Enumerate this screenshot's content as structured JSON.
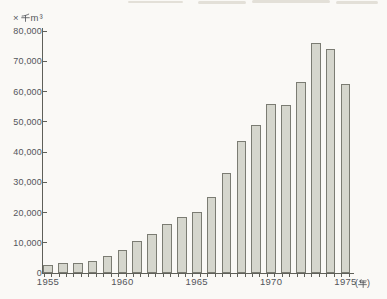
{
  "colors": {
    "background": "#faf9f6",
    "bar_fill": "#d5d6cd",
    "bar_border": "#7b7c73",
    "axis": "#5f6059",
    "text": "#53555a",
    "scan_artifact": "#dcd8cf"
  },
  "chart_data": {
    "type": "bar",
    "title": "",
    "unit_label": "×千m³",
    "x_axis_suffix": "(年)",
    "xlabel": "年",
    "ylabel": "千m³",
    "categories": [
      1955,
      1956,
      1957,
      1958,
      1959,
      1960,
      1961,
      1962,
      1963,
      1964,
      1965,
      1966,
      1967,
      1968,
      1969,
      1970,
      1971,
      1972,
      1973,
      1974,
      1975
    ],
    "values": [
      2500,
      3400,
      3300,
      4000,
      5500,
      7500,
      10500,
      13000,
      16300,
      18500,
      20000,
      25000,
      33000,
      43500,
      49000,
      56000,
      55500,
      63000,
      76000,
      74000,
      62500
    ],
    "y_tick_labels": [
      "80,000",
      "70,000",
      "60,000",
      "50,000",
      "40,000",
      "30,000",
      "20,000",
      "10,000",
      "0"
    ],
    "x_tick_labels": [
      "1955",
      "1960",
      "1965",
      "1970",
      "1975"
    ],
    "ylim": [
      0,
      80000
    ],
    "y_tick_interval": 10000,
    "grid": false,
    "legend": "none"
  }
}
